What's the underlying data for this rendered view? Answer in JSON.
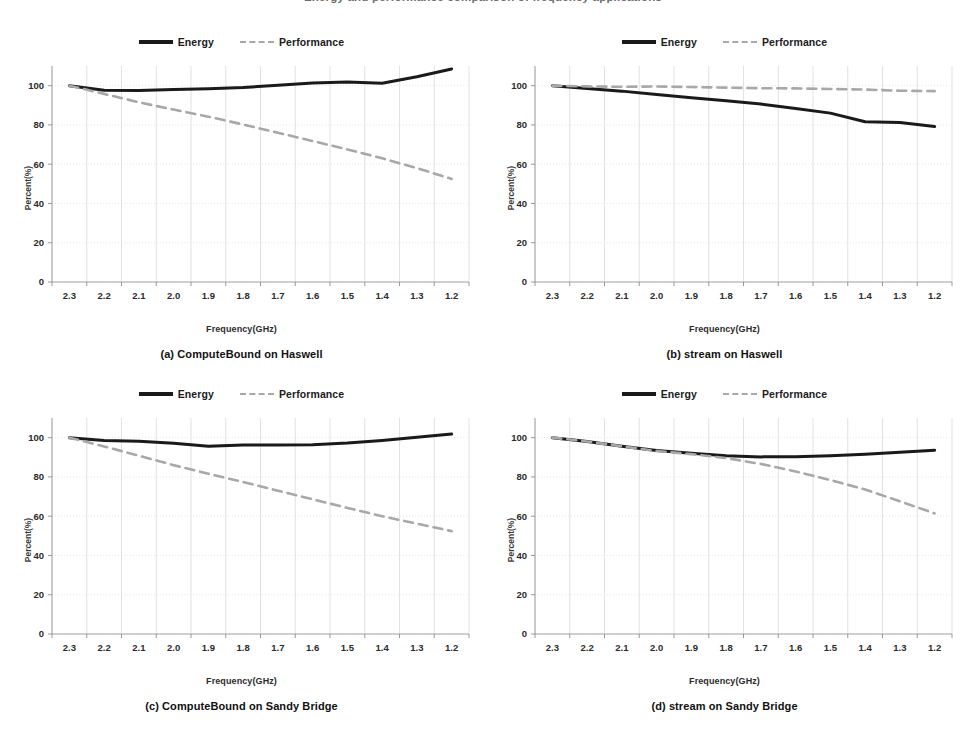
{
  "figure": {
    "title_partial": "Energy and performance comparison of frequency applications",
    "legend": {
      "energy_label": "Energy",
      "performance_label": "Performance",
      "energy_color": "#1a1a1a",
      "performance_color": "#a8a8a8"
    },
    "axis": {
      "xlabel": "Frequency(GHz)",
      "ylabel": "Percent(%)",
      "ytick_labels": [
        "0",
        "20",
        "40",
        "60",
        "80",
        "100"
      ],
      "xtick_labels": [
        "2.3",
        "2.2",
        "2.1",
        "2.0",
        "1.9",
        "1.8",
        "1.7",
        "1.6",
        "1.5",
        "1.4",
        "1.3",
        "1.2"
      ]
    },
    "captions": {
      "a": "(a) ComputeBound on Haswell",
      "b": "(b) stream on Haswell",
      "c": "(c) ComputeBound on Sandy Bridge",
      "d": "(d) stream on Sandy Bridge"
    }
  },
  "chart_data": [
    {
      "id": "a",
      "type": "line",
      "title": "(a) ComputeBound on Haswell",
      "xlabel": "Frequency(GHz)",
      "ylabel": "Percent(%)",
      "categories": [
        "2.3",
        "2.2",
        "2.1",
        "2.0",
        "1.9",
        "1.8",
        "1.7",
        "1.6",
        "1.5",
        "1.4",
        "1.3",
        "1.2"
      ],
      "ylim": [
        0,
        110
      ],
      "yticks": [
        0,
        20,
        40,
        60,
        80,
        100
      ],
      "grid": true,
      "legend_position": "top-center",
      "series": [
        {
          "name": "Energy",
          "style": "solid",
          "color": "#1a1a1a",
          "values": [
            100.0,
            97.6,
            97.5,
            98.0,
            98.4,
            99.0,
            100.2,
            101.3,
            101.8,
            101.2,
            104.5,
            108.5
          ]
        },
        {
          "name": "Performance",
          "style": "dashed",
          "color": "#a8a8a8",
          "values": [
            100.0,
            95.8,
            91.5,
            87.8,
            84.2,
            80.2,
            76.0,
            71.8,
            67.5,
            63.0,
            58.0,
            52.5
          ]
        }
      ]
    },
    {
      "id": "b",
      "type": "line",
      "title": "(b) stream on Haswell",
      "xlabel": "Frequency(GHz)",
      "ylabel": "Percent(%)",
      "categories": [
        "2.3",
        "2.2",
        "2.1",
        "2.0",
        "1.9",
        "1.8",
        "1.7",
        "1.6",
        "1.5",
        "1.4",
        "1.3",
        "1.2"
      ],
      "ylim": [
        0,
        110
      ],
      "yticks": [
        0,
        20,
        40,
        60,
        80,
        100
      ],
      "grid": true,
      "legend_position": "top-center",
      "series": [
        {
          "name": "Energy",
          "style": "solid",
          "color": "#1a1a1a",
          "values": [
            100.0,
            98.5,
            97.2,
            95.5,
            93.8,
            92.3,
            90.6,
            88.4,
            86.0,
            81.6,
            81.2,
            79.2
          ]
        },
        {
          "name": "Performance",
          "style": "dashed",
          "color": "#a8a8a8",
          "values": [
            100.0,
            99.6,
            99.4,
            99.6,
            99.3,
            99.0,
            98.7,
            98.6,
            98.3,
            98.0,
            97.4,
            97.2
          ]
        }
      ]
    },
    {
      "id": "c",
      "type": "line",
      "title": "(c) ComputeBound on Sandy Bridge",
      "xlabel": "Frequency(GHz)",
      "ylabel": "Percent(%)",
      "categories": [
        "2.3",
        "2.2",
        "2.1",
        "2.0",
        "1.9",
        "1.8",
        "1.7",
        "1.6",
        "1.5",
        "1.4",
        "1.3",
        "1.2"
      ],
      "ylim": [
        0,
        110
      ],
      "yticks": [
        0,
        20,
        40,
        60,
        80,
        100
      ],
      "grid": true,
      "legend_position": "top-center",
      "series": [
        {
          "name": "Energy",
          "style": "solid",
          "color": "#1a1a1a",
          "values": [
            100.0,
            98.6,
            98.2,
            97.1,
            95.6,
            96.2,
            96.3,
            96.4,
            97.3,
            98.6,
            100.2,
            101.8
          ]
        },
        {
          "name": "Performance",
          "style": "dashed",
          "color": "#a8a8a8",
          "values": [
            100.0,
            95.5,
            90.8,
            86.0,
            81.6,
            77.4,
            73.0,
            68.6,
            64.2,
            60.0,
            56.2,
            52.4
          ]
        }
      ]
    },
    {
      "id": "d",
      "type": "line",
      "title": "(d) stream on Sandy Bridge",
      "xlabel": "Frequency(GHz)",
      "ylabel": "Percent(%)",
      "categories": [
        "2.3",
        "2.2",
        "2.1",
        "2.0",
        "1.9",
        "1.8",
        "1.7",
        "1.6",
        "1.5",
        "1.4",
        "1.3",
        "1.2"
      ],
      "ylim": [
        0,
        110
      ],
      "yticks": [
        0,
        20,
        40,
        60,
        80,
        100
      ],
      "grid": true,
      "legend_position": "top-center",
      "series": [
        {
          "name": "Energy",
          "style": "solid",
          "color": "#1a1a1a",
          "values": [
            100.0,
            98.0,
            95.6,
            93.5,
            92.0,
            90.8,
            90.2,
            90.3,
            90.8,
            91.6,
            92.6,
            93.6
          ]
        },
        {
          "name": "Performance",
          "style": "dashed",
          "color": "#a8a8a8",
          "values": [
            100.0,
            98.0,
            95.6,
            93.2,
            91.6,
            89.6,
            86.6,
            82.8,
            78.4,
            73.6,
            67.6,
            61.4
          ]
        }
      ]
    }
  ]
}
